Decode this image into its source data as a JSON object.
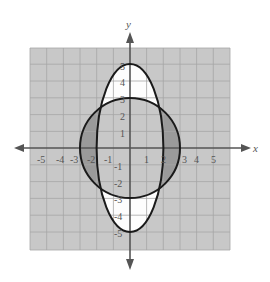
{
  "diagram": {
    "type": "graph-of-conic-regions",
    "grid": {
      "xmin": -6,
      "xmax": 6,
      "ymin": -6,
      "ymax": 6,
      "step": 1
    },
    "axes": {
      "x_label": "x",
      "y_label": "y"
    },
    "x_ticks": [
      "-5",
      "-4",
      "-3",
      "-2",
      "-1",
      "1",
      "2",
      "3",
      "4",
      "5"
    ],
    "y_ticks": [
      "5",
      "4",
      "3",
      "2",
      "1",
      "-1",
      "-2",
      "-3",
      "-4",
      "-5"
    ],
    "curves": [
      {
        "name": "circle",
        "equation": "x^2 + y^2 = 9",
        "radius": 3
      },
      {
        "name": "ellipse",
        "equation": "x^2/4 + y^2/25 = 1",
        "semi_x": 2,
        "semi_y": 5
      }
    ],
    "regions": [
      {
        "name": "inside-ellipse-outside-circle",
        "fill": "#ffffff"
      },
      {
        "name": "inside-circle-outside-ellipse",
        "fill": "#9a9a9a"
      },
      {
        "name": "background",
        "fill": "#c8c8c8"
      }
    ],
    "colors": {
      "grid_bg": "#c8c8c8",
      "grid_line": "#a8a8a8",
      "curve": "#1a1a1a",
      "axis": "#555555",
      "dark_region": "#9a9a9a",
      "light_region": "#ffffff"
    }
  }
}
